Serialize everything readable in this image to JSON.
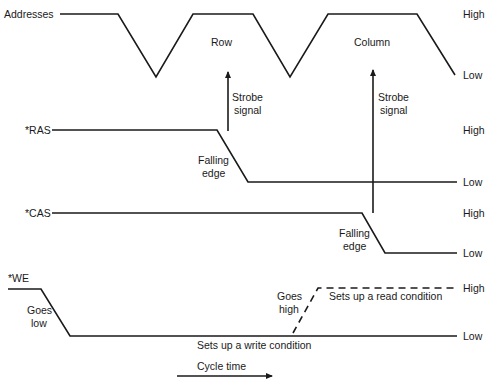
{
  "diagram": {
    "type": "timing-diagram",
    "signals": [
      {
        "name": "Addresses",
        "label": "Addresses",
        "high": "High",
        "low": "Low"
      },
      {
        "name": "RAS",
        "label": "*RAS",
        "high": "High",
        "low": "Low"
      },
      {
        "name": "CAS",
        "label": "*CAS",
        "high": "High",
        "low": "Low"
      },
      {
        "name": "WE",
        "label": "*WE",
        "high": "High",
        "low": "Low"
      }
    ],
    "annotations": {
      "row": "Row",
      "column": "Column",
      "strobe1_line1": "Strobe",
      "strobe1_line2": "signal",
      "strobe2_line1": "Strobe",
      "strobe2_line2": "signal",
      "ras_edge_line1": "Falling",
      "ras_edge_line2": "edge",
      "cas_edge_line1": "Falling",
      "cas_edge_line2": "edge",
      "we_low_line1": "Goes",
      "we_low_line2": "low",
      "we_high_line1": "Goes",
      "we_high_line2": "high",
      "read_condition": "Sets up a read condition",
      "write_condition": "Sets up a write condition",
      "cycle_time": "Cycle time"
    }
  }
}
